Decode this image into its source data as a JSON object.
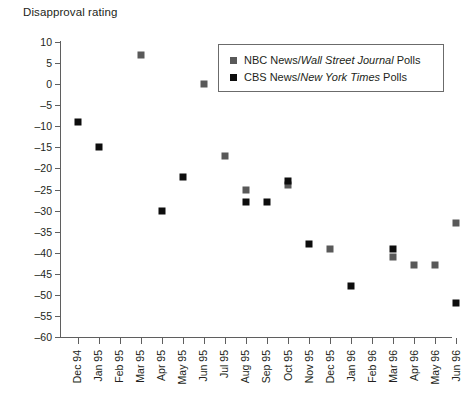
{
  "chart_data": {
    "type": "scatter",
    "title": "Disapproval rating",
    "xlabel": "",
    "ylabel": "",
    "ylim": [
      -60,
      10
    ],
    "ytick_step": 5,
    "yticks": [
      10,
      5,
      0,
      -5,
      -10,
      -15,
      -20,
      -25,
      -30,
      -35,
      -40,
      -45,
      -50,
      -55,
      -60
    ],
    "ytick_labels": [
      "10",
      "5",
      "0",
      "–5",
      "–10",
      "–15",
      "–20",
      "–25",
      "–30",
      "–35",
      "–40",
      "–45",
      "–50",
      "–55",
      "–60"
    ],
    "categories": [
      "Dec 94",
      "Jan 95",
      "Feb 95",
      "Mar 95",
      "Apr 95",
      "May 95",
      "Jun 95",
      "Jul 95",
      "Aug 95",
      "Sep 95",
      "Oct 95",
      "Nov 95",
      "Dec 95",
      "Jan 96",
      "Feb 96",
      "Mar 96",
      "Apr 96",
      "May 96",
      "Jun 96"
    ],
    "grid": false,
    "legend_position": "upper right",
    "series": [
      {
        "name": "NBC News/Wall Street Journal Polls",
        "name_prefix": "NBC News/",
        "name_italic": "Wall Street Journal",
        "name_suffix": " Polls",
        "color": "#595959",
        "marker": "square",
        "values": [
          null,
          null,
          null,
          7,
          null,
          null,
          0,
          -17,
          -25,
          null,
          -24,
          null,
          -39,
          null,
          null,
          -41,
          -43,
          -43,
          -33
        ]
      },
      {
        "name": "CBS News/New York Times Polls",
        "name_prefix": "CBS News/",
        "name_italic": "New York Times",
        "name_suffix": " Polls",
        "color": "#0d0d0d",
        "marker": "square",
        "values": [
          -9,
          -15,
          null,
          null,
          -30,
          -22,
          null,
          null,
          -28,
          -28,
          -23,
          -38,
          null,
          -48,
          null,
          -39,
          null,
          null,
          -52
        ]
      }
    ]
  },
  "colors": {
    "nbc": "#595959",
    "cbs": "#0d0d0d",
    "axis": "#5f5f5f",
    "text": "#231f20",
    "background": "#ffffff"
  }
}
